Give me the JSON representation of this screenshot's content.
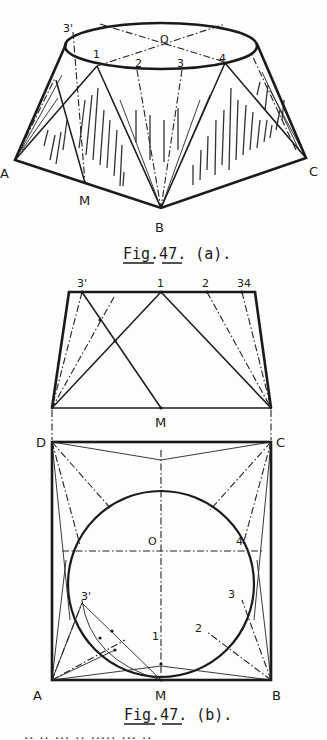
{
  "figure_a": {
    "caption": "Fig.47. (a).",
    "title": "Pictorial view of transition piece (circle to square)",
    "labels": {
      "three_prime": "3'",
      "O": "O",
      "one": "1",
      "two": "2",
      "three": "3",
      "four": "4",
      "A": "A",
      "M": "M",
      "B": "B",
      "C": "C"
    },
    "points": {
      "ellipse_center": [
        161,
        54
      ],
      "ellipse_rx": 94,
      "ellipse_ry": 21,
      "p3prime": [
        70,
        31
      ],
      "p1": [
        97,
        67
      ],
      "p2": [
        137,
        70
      ],
      "p3": [
        182,
        70
      ],
      "p4": [
        225,
        63
      ],
      "A": [
        15,
        160
      ],
      "M": [
        85,
        183
      ],
      "B": [
        161,
        208
      ],
      "C": [
        306,
        158
      ]
    }
  },
  "figure_b_elevation": {
    "labels": {
      "three_prime": "3'",
      "one": "1",
      "two": "2",
      "three_four": "34",
      "M": "M"
    },
    "points": {
      "top_left": [
        69,
        292
      ],
      "top_right": [
        255,
        292
      ],
      "bottom_left": [
        52,
        408
      ],
      "bottom_right": [
        271,
        408
      ],
      "p3prime": [
        82,
        292
      ],
      "p1": [
        161,
        292
      ],
      "p2": [
        207,
        292
      ],
      "p3": [
        242,
        292
      ],
      "M": [
        161,
        408
      ]
    }
  },
  "figure_b_plan": {
    "caption": "Fig.47. (b).",
    "labels": {
      "D": "D",
      "C": "C",
      "A": "A",
      "B": "B",
      "M": "M",
      "O": "O",
      "one": "1",
      "two": "2",
      "three": "3",
      "three_prime": "3'",
      "four": "4"
    },
    "points": {
      "D": [
        52,
        442
      ],
      "C": [
        271,
        442
      ],
      "B": [
        271,
        680
      ],
      "A": [
        52,
        680
      ],
      "M": [
        161,
        680
      ],
      "circle_center": [
        161,
        591
      ],
      "circle_r": 93
    }
  },
  "footer": {
    "truncated_text": "·· ·· ··· ·· ····· ··· ··"
  }
}
